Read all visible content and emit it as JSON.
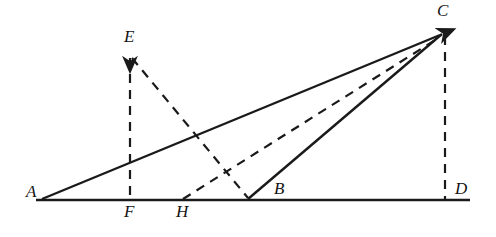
{
  "figure": {
    "kind": "geometry-diagram",
    "width": 496,
    "height": 237,
    "background_color": "#ffffff",
    "stroke_color": "#1a1a1a"
  },
  "labels": {
    "A": "A",
    "B": "B",
    "C": "C",
    "D": "D",
    "E": "E",
    "F": "F",
    "H": "H"
  },
  "points": {
    "A": {
      "x": 42,
      "y": 199,
      "label_x": 26,
      "label_y": 183
    },
    "B": {
      "x": 248,
      "y": 199,
      "label_x": 274,
      "label_y": 180
    },
    "C": {
      "x": 443,
      "y": 33,
      "label_x": 437,
      "label_y": 2
    },
    "D": {
      "x": 445,
      "y": 199,
      "label_x": 455,
      "label_y": 180
    },
    "E": {
      "x": 130,
      "y": 56,
      "label_x": 124,
      "label_y": 28
    },
    "F": {
      "x": 130,
      "y": 199,
      "label_x": 124,
      "label_y": 203
    },
    "H": {
      "x": 183,
      "y": 199,
      "label_x": 176,
      "label_y": 203
    }
  },
  "segments": {
    "baseline": {
      "name": "baseline-AD",
      "x1": 36,
      "y1": 200,
      "x2": 470,
      "y2": 200,
      "style": "solid",
      "width": 2.6
    },
    "AC": {
      "name": "segment-A-to-C",
      "x1": 42,
      "y1": 199,
      "x2": 440,
      "y2": 35,
      "style": "solid",
      "width": 2.4,
      "arrow": "end"
    },
    "BC": {
      "name": "segment-B-to-C",
      "x1": 248,
      "y1": 199,
      "x2": 442,
      "y2": 34,
      "style": "solid",
      "width": 2.4
    },
    "EF": {
      "name": "segment-E-to-F",
      "x1": 130,
      "y1": 58,
      "x2": 130,
      "y2": 199,
      "style": "dashed",
      "width": 2.2,
      "arrow": "start"
    },
    "CD": {
      "name": "segment-C-to-D",
      "x1": 445,
      "y1": 36,
      "x2": 445,
      "y2": 199,
      "style": "dashed",
      "width": 2.2
    },
    "EB": {
      "name": "segment-E-to-B",
      "x1": 132,
      "y1": 58,
      "x2": 248,
      "y2": 198,
      "style": "dashed",
      "width": 2.2
    },
    "HC": {
      "name": "segment-H-to-C",
      "x1": 183,
      "y1": 199,
      "x2": 440,
      "y2": 37,
      "style": "dashed",
      "width": 2.2
    }
  }
}
